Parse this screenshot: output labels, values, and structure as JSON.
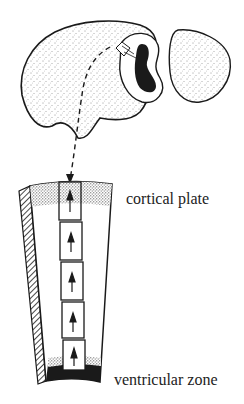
{
  "figure": {
    "labels": {
      "cortical_plate": "cortical plate",
      "ventricular_zone": "ventricular zone"
    },
    "colors": {
      "ink": "#1a1a1a",
      "paper": "#ffffff",
      "label_text": "#222222"
    },
    "elements": {
      "brain": "stippled lateral view of embryonic brain hemisphere with cut section",
      "section": "coronal cut showing dark ventricle",
      "cerebellum": "separate stippled lobe",
      "migration_path": "dashed arrow from cortex down to column",
      "column": "radial column of cortex with stacked boxes and upward arrows",
      "boxes_count": 5
    }
  }
}
